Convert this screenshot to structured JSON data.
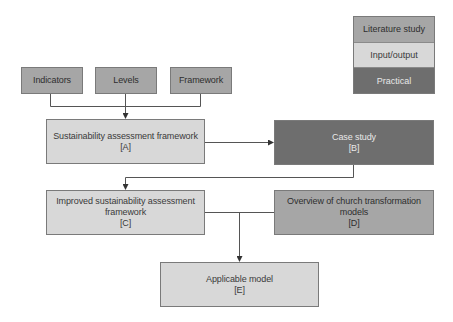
{
  "legend": {
    "items": [
      {
        "label": "Literature study",
        "color": "#a6a6a6"
      },
      {
        "label": "Input/output",
        "color": "#d8d8d8"
      },
      {
        "label": "Practical",
        "color": "#6e6e6e"
      }
    ]
  },
  "inputs": {
    "indicators": "Indicators",
    "levels": "Levels",
    "framework": "Framework"
  },
  "nodes": {
    "a": {
      "title": "Sustainability assessment framework",
      "tag": "[A]",
      "type": "Input/output"
    },
    "b": {
      "title": "Case study",
      "tag": "[B]",
      "type": "Practical"
    },
    "c": {
      "title_line1": "Improved sustainability assessment",
      "title_line2": "framework",
      "tag": "[C]",
      "type": "Input/output"
    },
    "d": {
      "title_line1": "Overview of church transformation",
      "title_line2": "models",
      "tag": "[D]",
      "type": "Literature study"
    },
    "e": {
      "title": "Applicable model",
      "tag": "[E]",
      "type": "Input/output"
    }
  },
  "edges": [
    {
      "from": "Indicators",
      "to": "A"
    },
    {
      "from": "Levels",
      "to": "A"
    },
    {
      "from": "Framework",
      "to": "A"
    },
    {
      "from": "A",
      "to": "B"
    },
    {
      "from": "B",
      "to": "C"
    },
    {
      "from": "C",
      "to": "E"
    },
    {
      "from": "D",
      "to": "E"
    }
  ]
}
